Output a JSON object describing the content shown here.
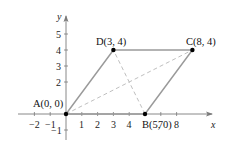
{
  "diagram": {
    "type": "parallelogram-on-coordinate-plane",
    "axes": {
      "x_label": "x",
      "y_label": "y",
      "x_ticks": [
        "−2",
        "−1",
        "1",
        "2",
        "3",
        "4",
        "7",
        "8"
      ],
      "y_ticks": [
        "5",
        "4",
        "3",
        "2",
        "−1"
      ]
    },
    "points": [
      {
        "name": "A",
        "label": "A(0, 0)",
        "x": 0,
        "y": 0
      },
      {
        "name": "B",
        "label": "B(5, 0)",
        "x": 5,
        "y": 0
      },
      {
        "name": "C",
        "label": "C(8, 4)",
        "x": 8,
        "y": 4
      },
      {
        "name": "D",
        "label": "D(3, 4)",
        "x": 3,
        "y": 4
      }
    ],
    "sides": [
      "AB",
      "BC",
      "CD",
      "DA"
    ],
    "diagonals_dashed": [
      "AC",
      "BD"
    ],
    "colors": {
      "sides": "#9a9a9a",
      "diagonals": "#b0b0b0",
      "axes": "#7a7a7a",
      "points": "#000000"
    }
  }
}
